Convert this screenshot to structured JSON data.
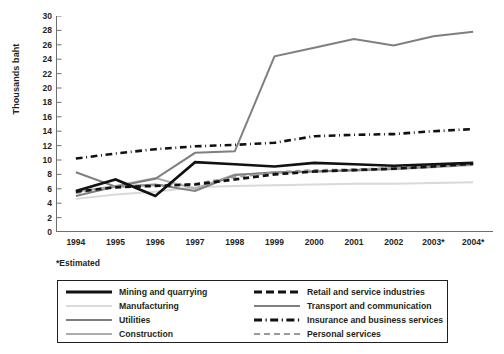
{
  "chart_data": {
    "type": "line",
    "title": "",
    "subtitle": "",
    "xlabel": "",
    "ylabel": "Thousands baht",
    "footnote": "*Estimated",
    "grid": false,
    "legend_position": "bottom",
    "x": [
      "1994",
      "1995",
      "1996",
      "1997",
      "1998",
      "1999",
      "2000",
      "2001",
      "2002",
      "2003*",
      "2004*"
    ],
    "xlim": [
      "1994",
      "2004*"
    ],
    "ylim": [
      0,
      30
    ],
    "yticks": [
      30,
      28,
      26,
      24,
      22,
      20,
      18,
      16,
      14,
      12,
      10,
      8,
      6,
      4,
      2,
      0
    ],
    "ytick_step": 2,
    "series": [
      {
        "name": "Mining and quarrying",
        "style": "solid",
        "width": 2.6,
        "color": "#111111",
        "values": [
          5.7,
          7.3,
          5.0,
          9.7,
          9.4,
          9.1,
          9.6,
          9.4,
          9.2,
          9.4,
          9.6
        ]
      },
      {
        "name": "Manufacturing",
        "style": "solid",
        "width": 2.0,
        "color": "#d9d9d9",
        "values": [
          4.6,
          5.2,
          5.6,
          6.2,
          6.4,
          6.5,
          6.6,
          6.7,
          6.7,
          6.8,
          6.9
        ]
      },
      {
        "name": "Utilities",
        "style": "solid",
        "width": 2.0,
        "color": "#7f7f7f",
        "values": [
          8.3,
          6.3,
          6.6,
          5.7,
          7.9,
          8.3,
          8.4,
          8.6,
          8.8,
          9.1,
          9.4
        ]
      },
      {
        "name": "Construction",
        "style": "solid",
        "width": 2.0,
        "color": "#adadad",
        "values": [
          5.6,
          6.4,
          7.5,
          6.0,
          8.0,
          8.2,
          8.4,
          8.5,
          8.7,
          9.0,
          9.3
        ]
      },
      {
        "name": "Retail and service industries",
        "style": "dashed",
        "width": 2.6,
        "color": "#111111",
        "values": [
          5.6,
          6.2,
          6.4,
          6.6,
          7.3,
          8.0,
          8.4,
          8.6,
          8.8,
          9.1,
          9.5
        ]
      },
      {
        "name": "Transport and communication",
        "style": "solid",
        "width": 2.0,
        "color": "#7f7f7f",
        "values": [
          5.0,
          6.3,
          7.4,
          11.0,
          11.2,
          24.4,
          25.6,
          26.8,
          25.9,
          27.2,
          27.8
        ]
      },
      {
        "name": "Insurance and business services",
        "style": "dashdot",
        "width": 2.6,
        "color": "#111111",
        "values": [
          10.2,
          10.9,
          11.5,
          11.9,
          12.1,
          12.4,
          13.3,
          13.5,
          13.6,
          14.0,
          14.3
        ]
      },
      {
        "name": "Personal services",
        "style": "dashed-gray",
        "width": 2.0,
        "color": "#9a9a9a",
        "values": [
          5.4,
          6.3,
          6.5,
          6.7,
          7.6,
          8.3,
          8.6,
          8.7,
          8.9,
          9.2,
          9.6
        ]
      }
    ]
  },
  "axes": {
    "y_title": "Thousands baht",
    "y_ticks": [
      "30",
      "28",
      "26",
      "24",
      "22",
      "20",
      "18",
      "16",
      "14",
      "12",
      "10",
      "8",
      "6",
      "4",
      "2",
      "0"
    ],
    "x_ticks": [
      "1994",
      "1995",
      "1996",
      "1997",
      "1998",
      "1999",
      "2000",
      "2001",
      "2002",
      "2003*",
      "2004*"
    ]
  },
  "footnote": {
    "text": "*Estimated"
  },
  "legend": {
    "left_column": [
      {
        "label": "Mining and quarrying",
        "swatch": "thick-solid-black"
      },
      {
        "label": "Manufacturing",
        "swatch": "solid-light-gray"
      },
      {
        "label": "Utilities",
        "swatch": "solid-medium-gray"
      },
      {
        "label": "Construction",
        "swatch": "solid-gray"
      }
    ],
    "right_column": [
      {
        "label": "Retail and service industries",
        "swatch": "thick-dashed-black"
      },
      {
        "label": "Transport and communication",
        "swatch": "solid-medium-gray"
      },
      {
        "label": "Insurance and business services",
        "swatch": "thick-dashdot-black"
      },
      {
        "label": "Personal services",
        "swatch": "dashed-gray"
      }
    ]
  },
  "colors": {
    "axis": "#6d6e71",
    "text": "#231f20",
    "black_series": "#111111",
    "medium_gray": "#7f7f7f",
    "gray": "#adadad",
    "light_gray": "#d9d9d9",
    "personal_gray": "#9a9a9a"
  }
}
